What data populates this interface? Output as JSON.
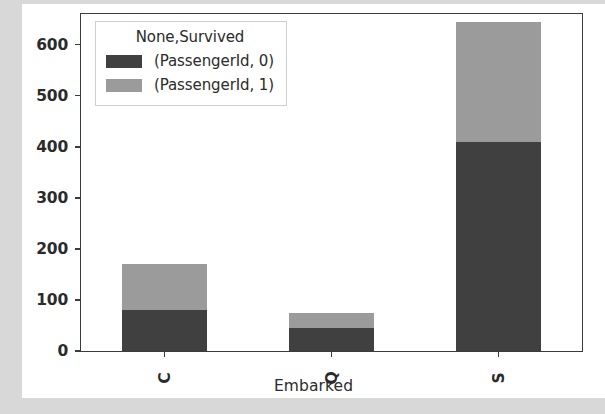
{
  "chart_data": {
    "type": "bar",
    "stacked": true,
    "title": "",
    "subtitle": "",
    "xlabel": "Embarked",
    "ylabel": "",
    "categories": [
      "C",
      "Q",
      "S"
    ],
    "series": [
      {
        "name": "(PassengerId, 0)",
        "color": "#404040",
        "values": [
          81,
          46,
          410
        ]
      },
      {
        "name": "(PassengerId, 1)",
        "color": "#9b9b9b",
        "values": [
          89,
          29,
          234
        ]
      }
    ],
    "stack_totals": [
      170,
      75,
      644
    ],
    "ylim": [
      0,
      660
    ],
    "yticks": [
      0,
      100,
      200,
      300,
      400,
      500,
      600
    ],
    "ytick_labels": [
      "0",
      "100",
      "200",
      "300",
      "400",
      "500",
      "600"
    ],
    "xtick_labels": [
      "C",
      "Q",
      "S"
    ],
    "xtick_rotation": 90,
    "grid": false,
    "legend": {
      "title": "None,Survived",
      "position": "upper left",
      "entries": [
        {
          "label": "(PassengerId, 0)",
          "color": "#404040"
        },
        {
          "label": "(PassengerId, 1)",
          "color": "#9b9b9b"
        }
      ]
    }
  },
  "figure": {
    "background": "#ffffff",
    "page_background": "#d8d8d8",
    "axes_edge_color": "#3b3b3b"
  }
}
